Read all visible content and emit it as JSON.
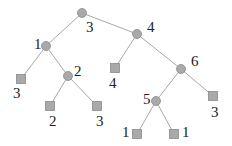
{
  "diagram": {
    "type": "tree",
    "colors": {
      "node": "#a9a9a9",
      "edge": "#a8a8a8",
      "label": "#222222"
    },
    "nodes": [
      {
        "id": "root",
        "shape": "circle",
        "x": 82,
        "y": 13,
        "label": "3",
        "lx": 86,
        "ly": 32
      },
      {
        "id": "n1",
        "shape": "circle",
        "x": 46,
        "y": 46,
        "label": "1",
        "lx": 34,
        "ly": 49
      },
      {
        "id": "l3a",
        "shape": "square",
        "x": 21,
        "y": 79,
        "label": "3",
        "lx": 13,
        "ly": 98
      },
      {
        "id": "n2",
        "shape": "circle",
        "x": 68,
        "y": 76,
        "label": "2",
        "lx": 74,
        "ly": 76
      },
      {
        "id": "l2",
        "shape": "square",
        "x": 50,
        "y": 106,
        "label": "2",
        "lx": 49,
        "ly": 126
      },
      {
        "id": "l3b",
        "shape": "square",
        "x": 97,
        "y": 106,
        "label": "3",
        "lx": 96,
        "ly": 126
      },
      {
        "id": "n4",
        "shape": "circle",
        "x": 137,
        "y": 34,
        "label": "4",
        "lx": 147,
        "ly": 32
      },
      {
        "id": "l4",
        "shape": "square",
        "x": 115,
        "y": 68,
        "label": "4",
        "lx": 109,
        "ly": 88
      },
      {
        "id": "n6",
        "shape": "circle",
        "x": 181,
        "y": 69,
        "label": "6",
        "lx": 191,
        "ly": 66
      },
      {
        "id": "n5",
        "shape": "circle",
        "x": 156,
        "y": 101,
        "label": "5",
        "lx": 143,
        "ly": 104
      },
      {
        "id": "l3c",
        "shape": "square",
        "x": 213,
        "y": 96,
        "label": "3",
        "lx": 211,
        "ly": 117
      },
      {
        "id": "l1a",
        "shape": "square",
        "x": 137,
        "y": 134,
        "label": "1",
        "lx": 122,
        "ly": 137
      },
      {
        "id": "l1b",
        "shape": "square",
        "x": 174,
        "y": 134,
        "label": "1",
        "lx": 182,
        "ly": 137
      }
    ],
    "edges": [
      [
        "root",
        "n1"
      ],
      [
        "root",
        "n4"
      ],
      [
        "n1",
        "l3a"
      ],
      [
        "n1",
        "n2"
      ],
      [
        "n2",
        "l2"
      ],
      [
        "n2",
        "l3b"
      ],
      [
        "n4",
        "l4"
      ],
      [
        "n4",
        "n6"
      ],
      [
        "n6",
        "n5"
      ],
      [
        "n6",
        "l3c"
      ],
      [
        "n5",
        "l1a"
      ],
      [
        "n5",
        "l1b"
      ]
    ]
  }
}
